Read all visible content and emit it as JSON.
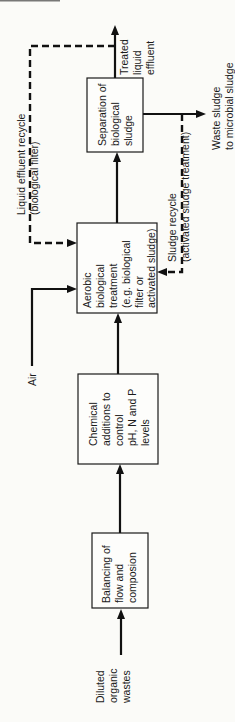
{
  "diagram": {
    "type": "process-flow",
    "orientation": "rotated-90-ccw",
    "nodes": [
      {
        "id": "balancing",
        "lines": [
          "Balancing of",
          "flow and",
          "composion"
        ]
      },
      {
        "id": "chemical",
        "lines": [
          "Chemical",
          "additions to",
          "control",
          "pH, N and P",
          "levels"
        ]
      },
      {
        "id": "aerobic",
        "lines": [
          "Aerobic",
          "biological",
          "treatment",
          "(e.g. biological",
          "filter or",
          "activated sludge)"
        ]
      },
      {
        "id": "separation",
        "lines": [
          "Separation of",
          "biological",
          "sludge"
        ]
      }
    ],
    "inputs": {
      "diluted": [
        "Diluted",
        "organic",
        "wastes"
      ],
      "air": "Air"
    },
    "outputs": {
      "treated": [
        "Treated",
        "liquid",
        "effluent"
      ],
      "waste": [
        "Waste sludge",
        "to microbial sludge"
      ]
    },
    "recycles": {
      "liquid": [
        "Liquid effluent recycle",
        "(biological filter)"
      ],
      "sludge": [
        "Sludge recycle",
        "(activated sludge treatment)"
      ]
    },
    "edges": [
      {
        "from": "diluted",
        "to": "balancing",
        "style": "solid"
      },
      {
        "from": "balancing",
        "to": "chemical",
        "style": "solid"
      },
      {
        "from": "chemical",
        "to": "aerobic",
        "style": "solid"
      },
      {
        "from": "air",
        "to": "aerobic",
        "style": "solid"
      },
      {
        "from": "aerobic",
        "to": "separation",
        "style": "solid"
      },
      {
        "from": "separation",
        "to": "treated",
        "style": "solid"
      },
      {
        "from": "separation",
        "to": "waste",
        "style": "solid"
      },
      {
        "from": "treated",
        "to": "aerobic",
        "style": "dashed",
        "label": "liquid"
      },
      {
        "from": "waste",
        "to": "aerobic",
        "style": "dashed",
        "label": "sludge"
      }
    ]
  }
}
